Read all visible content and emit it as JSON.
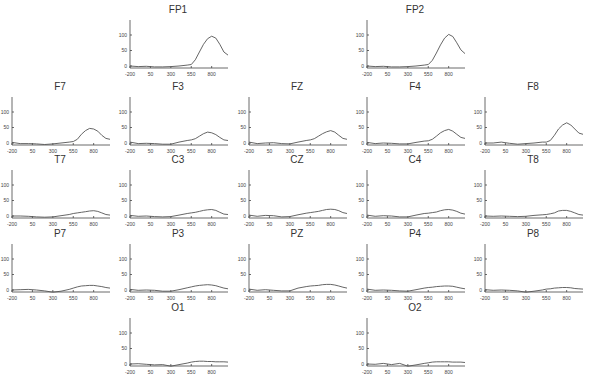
{
  "figure": {
    "title_cut_off": "",
    "layout_rows": [
      [
        "FP1",
        "FP2"
      ],
      [
        "F7",
        "F3",
        "FZ",
        "F4",
        "F8"
      ],
      [
        "T7",
        "C3",
        "CZ",
        "C4",
        "T8"
      ],
      [
        "P7",
        "P3",
        "PZ",
        "P4",
        "P8"
      ],
      [
        "O1",
        "O2"
      ]
    ]
  },
  "chart_data": {
    "type": "line",
    "title": "",
    "xlabel": "",
    "ylabel": "",
    "x_ticks": [
      "-200",
      "50",
      "300",
      "550",
      "800"
    ],
    "y_ticks": [
      "0",
      "50",
      "100"
    ],
    "xlim": [
      -200,
      1000
    ],
    "ylim": [
      -10,
      130
    ],
    "grid": false,
    "legend": "none",
    "x": [
      -200,
      -100,
      0,
      100,
      200,
      300,
      400,
      500,
      550,
      600,
      650,
      700,
      750,
      800,
      850,
      900,
      950,
      1000
    ],
    "panels": [
      {
        "name": "FP1",
        "values": [
          0,
          -2,
          -1,
          -3,
          -3,
          -2,
          0,
          3,
          5,
          20,
          45,
          70,
          88,
          96,
          90,
          70,
          45,
          35
        ]
      },
      {
        "name": "FP2",
        "values": [
          0,
          -2,
          -1,
          -3,
          -3,
          -2,
          0,
          3,
          5,
          18,
          42,
          68,
          90,
          102,
          95,
          75,
          52,
          40
        ]
      },
      {
        "name": "F7",
        "values": [
          2,
          -2,
          -2,
          -3,
          -5,
          -3,
          0,
          3,
          5,
          12,
          28,
          40,
          47,
          45,
          38,
          25,
          15,
          12
        ]
      },
      {
        "name": "F3",
        "values": [
          3,
          -2,
          -1,
          -2,
          -4,
          -4,
          3,
          8,
          10,
          14,
          22,
          30,
          35,
          33,
          27,
          18,
          10,
          8
        ]
      },
      {
        "name": "FZ",
        "values": [
          3,
          -2,
          0,
          1,
          -2,
          -3,
          3,
          8,
          10,
          14,
          22,
          30,
          36,
          40,
          35,
          25,
          15,
          12
        ]
      },
      {
        "name": "F4",
        "values": [
          2,
          -2,
          0,
          -1,
          -3,
          -3,
          2,
          6,
          7,
          12,
          22,
          33,
          40,
          44,
          38,
          28,
          18,
          15
        ]
      },
      {
        "name": "F8",
        "values": [
          0,
          0,
          3,
          -1,
          -4,
          -2,
          0,
          3,
          3,
          8,
          25,
          45,
          58,
          65,
          58,
          45,
          32,
          28
        ]
      },
      {
        "name": "T7",
        "values": [
          0,
          0,
          -1,
          -3,
          -4,
          -3,
          1,
          5,
          8,
          10,
          12,
          14,
          16,
          17,
          15,
          10,
          5,
          3
        ]
      },
      {
        "name": "C3",
        "values": [
          2,
          -1,
          0,
          -2,
          -3,
          -2,
          3,
          8,
          10,
          12,
          15,
          18,
          20,
          21,
          18,
          12,
          6,
          5
        ]
      },
      {
        "name": "CZ",
        "values": [
          3,
          -1,
          2,
          1,
          -3,
          -2,
          4,
          9,
          11,
          13,
          15,
          18,
          21,
          22,
          21,
          17,
          11,
          8
        ]
      },
      {
        "name": "C4",
        "values": [
          3,
          -1,
          1,
          0,
          -3,
          -3,
          3,
          8,
          9,
          11,
          13,
          17,
          20,
          21,
          19,
          15,
          9,
          6
        ]
      },
      {
        "name": "T8",
        "values": [
          0,
          -1,
          0,
          -1,
          -2,
          -1,
          2,
          4,
          5,
          7,
          10,
          16,
          18,
          18,
          15,
          10,
          5,
          3
        ]
      },
      {
        "name": "P7",
        "values": [
          0,
          1,
          2,
          0,
          -3,
          -7,
          -4,
          2,
          6,
          10,
          13,
          14,
          15,
          15,
          13,
          11,
          8,
          6
        ]
      },
      {
        "name": "P3",
        "values": [
          2,
          -1,
          0,
          -1,
          -4,
          -4,
          1,
          7,
          10,
          13,
          15,
          16,
          17,
          16,
          14,
          10,
          6,
          4
        ]
      },
      {
        "name": "PZ",
        "values": [
          3,
          -1,
          1,
          -1,
          -3,
          -3,
          6,
          11,
          13,
          14,
          15,
          17,
          18,
          18,
          16,
          13,
          9,
          6
        ]
      },
      {
        "name": "P4",
        "values": [
          3,
          -1,
          0,
          -1,
          -3,
          -4,
          1,
          6,
          8,
          9,
          11,
          12,
          13,
          13,
          12,
          9,
          6,
          4
        ]
      },
      {
        "name": "P8",
        "values": [
          1,
          -1,
          0,
          -1,
          -3,
          -7,
          -4,
          0,
          3,
          4,
          6,
          7,
          8,
          8,
          7,
          5,
          4,
          3
        ]
      },
      {
        "name": "O1",
        "values": [
          0,
          1,
          -1,
          -3,
          -2,
          -7,
          -2,
          3,
          6,
          8,
          9,
          9,
          8,
          8,
          7,
          7,
          7,
          6
        ]
      },
      {
        "name": "O2",
        "values": [
          0,
          -1,
          2,
          -2,
          2,
          -7,
          -3,
          2,
          4,
          6,
          7,
          7,
          7,
          7,
          6,
          6,
          6,
          5
        ]
      }
    ]
  }
}
